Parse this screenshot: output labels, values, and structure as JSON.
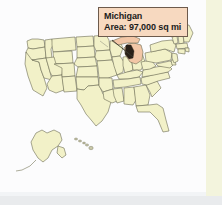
{
  "figure": {
    "type": "map",
    "subject": "United States",
    "description": "Outline map of the United States with all states drawn in pale yellow; the state of Michigan is shaded and labelled with a callout box.",
    "highlighted_state": "Michigan"
  },
  "callout": {
    "name": "Michigan",
    "area_line": "Area: 97,000 sq mi",
    "area_value": "97,000",
    "area_units": "sq mi",
    "background_color": "#f7d9c0",
    "border_color": "#6d5a4c",
    "text_color": "#1b1b1b"
  },
  "map": {
    "land_fill": "#f2f1c8",
    "land_stroke": "#6b6b54",
    "highlight_fill": "#f2c6a6",
    "water_fill": "#fcfcfd",
    "lake_fill": "#2a2018",
    "insets": [
      {
        "name": "Alaska",
        "position": "lower-left"
      },
      {
        "name": "Hawaii",
        "position": "lower-center"
      }
    ],
    "leader_line": {
      "from": "callout-bottom-left",
      "to": "Michigan"
    }
  },
  "canvas": {
    "right_strip_color": "#f3f4dd",
    "bottom_band_color": "#e9ebed",
    "background_color": "#fcfcfd"
  }
}
